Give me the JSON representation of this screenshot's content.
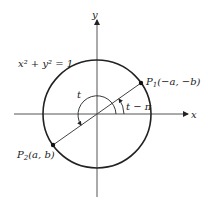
{
  "diagram": {
    "equation_label": "x² + y² = 1",
    "axes": {
      "x_label": "x",
      "y_label": "y"
    },
    "points": {
      "p1": {
        "name": "P",
        "subscript": "1",
        "coords": "(−a, −b)"
      },
      "p2": {
        "name": "P",
        "subscript": "2",
        "coords": "(a, b)"
      }
    },
    "angles": {
      "t_label": "t",
      "t_minus_pi_label": "t − π"
    },
    "colors": {
      "stroke": "#222222",
      "background": "#ffffff"
    }
  }
}
